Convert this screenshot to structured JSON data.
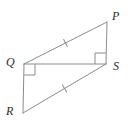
{
  "figure": {
    "kind": "geometry-diagram",
    "canvas": {
      "width": 133,
      "height": 126,
      "background": "#ffffff"
    },
    "stroke_color": "#8c8c8c",
    "mark_color": "#8c8c8c",
    "label_color": "#2b2b2b",
    "stroke_width": 1,
    "points": [
      {
        "id": "P",
        "label": "P",
        "x": 107,
        "y": 22,
        "label_x": 112,
        "label_y": 10
      },
      {
        "id": "Q",
        "label": "Q",
        "x": 24,
        "y": 64,
        "label_x": 6,
        "label_y": 56
      },
      {
        "id": "S",
        "label": "S",
        "x": 106,
        "y": 64,
        "label_x": 113,
        "label_y": 60
      },
      {
        "id": "R",
        "label": "R",
        "x": 23,
        "y": 113,
        "label_x": 6,
        "label_y": 105
      }
    ],
    "segments": [
      {
        "id": "QP",
        "from": "Q",
        "to": "P",
        "x1": 24,
        "y1": 64,
        "x2": 107,
        "y2": 22,
        "ticks": 1
      },
      {
        "id": "PS",
        "from": "P",
        "to": "S",
        "x1": 107,
        "y1": 22,
        "x2": 106,
        "y2": 64,
        "ticks": 0
      },
      {
        "id": "QS",
        "from": "Q",
        "to": "S",
        "x1": 24,
        "y1": 64,
        "x2": 106,
        "y2": 64,
        "ticks": 0
      },
      {
        "id": "QR",
        "from": "Q",
        "to": "R",
        "x1": 24,
        "y1": 64,
        "x2": 23,
        "y2": 113,
        "ticks": 0
      },
      {
        "id": "RS",
        "from": "R",
        "to": "S",
        "x1": 23,
        "y1": 113,
        "x2": 106,
        "y2": 64,
        "ticks": 1
      }
    ],
    "tick_marks": [
      {
        "id": "tick-QP",
        "on_segment": "QP",
        "count": 1,
        "cx": 65.5,
        "cy": 43,
        "angle_deg": -26.8
      },
      {
        "id": "tick-RS",
        "on_segment": "RS",
        "count": 1,
        "cx": 64.5,
        "cy": 88.5,
        "angle_deg": -30.5
      }
    ],
    "right_angles": [
      {
        "id": "right-angle-Q",
        "at_vertex": "Q",
        "size": 11,
        "dir_x": 1,
        "dir_y": 1
      },
      {
        "id": "right-angle-S",
        "at_vertex": "S",
        "size": 11,
        "dir_x": -1,
        "dir_y": -1
      }
    ]
  }
}
